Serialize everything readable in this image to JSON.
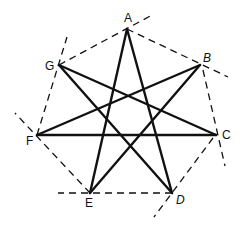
{
  "diagram": {
    "colors": {
      "star_stroke": "#111111",
      "dashed_stroke": "#111111",
      "background": "#ffffff"
    },
    "vertices": [
      {
        "id": "A",
        "label": "A",
        "x": 127,
        "y": 29,
        "label_x": 124,
        "label_y": 22
      },
      {
        "id": "B",
        "label": "B",
        "x": 200,
        "y": 65,
        "label_x": 203,
        "label_y": 62
      },
      {
        "id": "C",
        "label": "C",
        "x": 216,
        "y": 135,
        "label_x": 222,
        "label_y": 139
      },
      {
        "id": "D",
        "label": "D",
        "x": 172,
        "y": 193,
        "label_x": 176,
        "label_y": 204
      },
      {
        "id": "E",
        "label": "E",
        "x": 90,
        "y": 193,
        "label_x": 85,
        "label_y": 207
      },
      {
        "id": "F",
        "label": "F",
        "x": 37,
        "y": 135,
        "label_x": 26,
        "label_y": 145
      },
      {
        "id": "G",
        "label": "G",
        "x": 59,
        "y": 65,
        "label_x": 45,
        "label_y": 70
      }
    ],
    "star_edges": [
      [
        "A",
        "D"
      ],
      [
        "A",
        "E"
      ],
      [
        "B",
        "E"
      ],
      [
        "B",
        "F"
      ],
      [
        "C",
        "F"
      ],
      [
        "C",
        "G"
      ],
      [
        "D",
        "G"
      ]
    ],
    "dashed_edges": [
      {
        "from": "G",
        "to": "A",
        "x1": 59,
        "y1": 65,
        "x2": 154,
        "y2": 14
      },
      {
        "from": "A",
        "to": "B",
        "x1": 127,
        "y1": 29,
        "x2": 228,
        "y2": 77
      },
      {
        "from": "B",
        "to": "C",
        "x1": 203,
        "y1": 70,
        "x2": 225,
        "y2": 166
      },
      {
        "from": "C",
        "to": "D",
        "x1": 213,
        "y1": 138,
        "x2": 154,
        "y2": 217
      },
      {
        "from": "D",
        "to": "E",
        "x1": 172,
        "y1": 193,
        "x2": 58,
        "y2": 193
      },
      {
        "from": "E",
        "to": "F",
        "x1": 90,
        "y1": 193,
        "x2": 15,
        "y2": 113
      },
      {
        "from": "F",
        "to": "G",
        "x1": 37,
        "y1": 135,
        "x2": 67,
        "y2": 37
      }
    ]
  }
}
